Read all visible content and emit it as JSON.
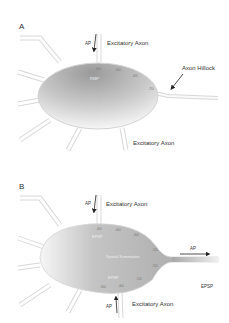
{
  "panel_a": {
    "label": "A",
    "top_axon_label": "Excitatory Axon",
    "top_ap_label": "AP",
    "hillock_label": "Axon Hillock",
    "bottom_axon_label": "Excitatory Axon",
    "inner_label": "RMP",
    "potentials": [
      "-60",
      "-60",
      "-65",
      "-70"
    ]
  },
  "panel_b": {
    "label": "B",
    "top_axon_label": "Excitatory Axon",
    "top_ap_label": "AP",
    "bottom_axon_label": "Excitatory Axon",
    "bottom_ap_label": "AP",
    "output_ap_label": "AP",
    "side_label": "EPSP",
    "inner_top_label": "EPSP",
    "inner_center_label": "Spatial Summation",
    "inner_bottom_label": "EPSP",
    "potentials_top": [
      "-60",
      "-60",
      "-60",
      "-55"
    ],
    "potentials_bottom": [
      "-55",
      "-55",
      "-60",
      "-60"
    ]
  },
  "colors": {
    "cell_dark": "#9a9a9a",
    "cell_light": "#f4f4f4",
    "process_outline": "#d6d6d6",
    "arrow": "#222222"
  }
}
